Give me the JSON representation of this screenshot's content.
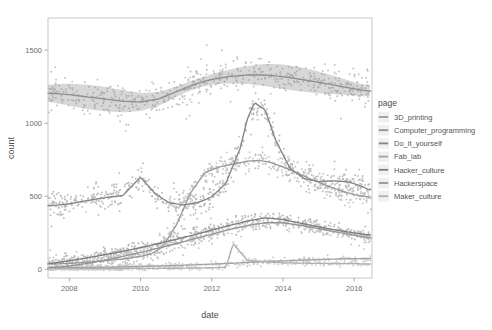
{
  "chart_data": {
    "type": "scatter",
    "title": "",
    "subtitle": "",
    "xlabel": "date",
    "ylabel": "count",
    "xlim": [
      2007.4,
      2016.5
    ],
    "ylim": [
      -60,
      1720
    ],
    "xticks": [
      2008,
      2010,
      2012,
      2014,
      2016
    ],
    "xtick_labels": [
      "2008",
      "2010",
      "2012",
      "2014",
      "2016"
    ],
    "yticks": [
      0,
      500,
      1000,
      1500
    ],
    "ytick_labels": [
      "0",
      "500",
      "1000",
      "1500"
    ],
    "grid": false,
    "legend_position": "right",
    "legend_title": "page",
    "smoother": "loess with confidence ribbon",
    "series": [
      {
        "name": "3D_printing",
        "color": "#9a9a9a",
        "x": [
          2007.5,
          2008.0,
          2008.5,
          2009.0,
          2009.5,
          2010.0,
          2010.3,
          2010.6,
          2011.0,
          2011.4,
          2011.8,
          2012.2,
          2012.6,
          2013.0,
          2013.3,
          2013.6,
          2014.0,
          2014.4,
          2014.8,
          2015.2,
          2015.6,
          2016.0,
          2016.4
        ],
        "values": [
          35,
          40,
          48,
          58,
          70,
          88,
          105,
          150,
          300,
          520,
          660,
          700,
          720,
          740,
          745,
          735,
          700,
          660,
          615,
          575,
          540,
          510,
          495
        ]
      },
      {
        "name": "Computer_programming",
        "color": "#8f8f8f",
        "x": [
          2007.5,
          2008.0,
          2008.5,
          2009.0,
          2009.5,
          2010.0,
          2010.5,
          2011.0,
          2011.5,
          2012.0,
          2012.5,
          2013.0,
          2013.5,
          2014.0,
          2014.5,
          2015.0,
          2015.5,
          2016.0,
          2016.4
        ],
        "values": [
          1205,
          1195,
          1180,
          1165,
          1150,
          1145,
          1165,
          1215,
          1265,
          1300,
          1320,
          1330,
          1330,
          1318,
          1300,
          1280,
          1258,
          1235,
          1220
        ]
      },
      {
        "name": "Do_it_yourself",
        "color": "#868686",
        "x": [
          2007.5,
          2008.0,
          2008.5,
          2009.0,
          2009.5,
          2010.0,
          2010.4,
          2010.8,
          2011.2,
          2011.6,
          2012.0,
          2012.4,
          2012.8,
          2013.0,
          2013.2,
          2013.5,
          2013.8,
          2014.2,
          2014.6,
          2015.0,
          2015.4,
          2015.8,
          2016.2,
          2016.4
        ],
        "values": [
          435,
          448,
          470,
          490,
          505,
          630,
          520,
          455,
          440,
          455,
          495,
          590,
          830,
          1030,
          1140,
          1090,
          880,
          690,
          620,
          600,
          605,
          600,
          570,
          545
        ]
      },
      {
        "name": "Fab_lab",
        "color": "#a3a3a3",
        "x": [
          2007.5,
          2008.5,
          2009.5,
          2010.5,
          2011.5,
          2012.5,
          2013.5,
          2014.5,
          2015.5,
          2016.4
        ],
        "values": [
          8,
          12,
          16,
          22,
          30,
          40,
          52,
          62,
          70,
          74
        ]
      },
      {
        "name": "Hacker_culture",
        "color": "#7d7d7d",
        "x": [
          2007.5,
          2008.0,
          2008.5,
          2009.0,
          2009.5,
          2010.0,
          2010.5,
          2011.0,
          2011.5,
          2012.0,
          2012.5,
          2013.0,
          2013.5,
          2014.0,
          2014.5,
          2015.0,
          2015.5,
          2016.0,
          2016.4
        ],
        "values": [
          40,
          58,
          78,
          100,
          122,
          148,
          175,
          205,
          235,
          268,
          300,
          330,
          352,
          340,
          315,
          290,
          268,
          248,
          235
        ]
      },
      {
        "name": "Hackerspace",
        "color": "#949494",
        "x": [
          2007.5,
          2008.0,
          2008.5,
          2009.0,
          2009.5,
          2010.0,
          2010.5,
          2011.0,
          2011.5,
          2012.0,
          2012.5,
          2013.0,
          2013.5,
          2014.0,
          2014.5,
          2015.0,
          2015.5,
          2016.0,
          2016.4
        ],
        "values": [
          10,
          22,
          40,
          62,
          88,
          115,
          145,
          175,
          208,
          240,
          272,
          300,
          318,
          318,
          300,
          278,
          255,
          232,
          215
        ]
      },
      {
        "name": "Maker_culture",
        "color": "#b0b0b0",
        "x": [
          2007.5,
          2009.0,
          2010.5,
          2011.5,
          2012.0,
          2012.4,
          2012.6,
          2013.0,
          2014.0,
          2015.0,
          2016.0,
          2016.4
        ],
        "values": [
          4,
          5,
          6,
          8,
          10,
          14,
          175,
          60,
          44,
          40,
          38,
          36
        ]
      }
    ],
    "band_series": "Computer_programming",
    "point_cloud": {
      "description": "Dense scattered daily observations around each smoothed trend",
      "marker": "circle",
      "size": 1.1,
      "opacity": 0.55,
      "color": "#8a8a8a"
    }
  },
  "legend": {
    "title": "page",
    "items": [
      {
        "label": "3D_printing",
        "swatch": "#9a9a9a"
      },
      {
        "label": "Computer_programming",
        "swatch": "#8f8f8f"
      },
      {
        "label": "Do_it_yourself",
        "swatch": "#868686"
      },
      {
        "label": "Fab_lab",
        "swatch": "#a3a3a3"
      },
      {
        "label": "Hacker_culture",
        "swatch": "#7d7d7d"
      },
      {
        "label": "Hackerspace",
        "swatch": "#949494"
      },
      {
        "label": "Maker_culture",
        "swatch": "#b0b0b0"
      }
    ]
  },
  "axes": {
    "x_title": "date",
    "y_title": "count"
  }
}
